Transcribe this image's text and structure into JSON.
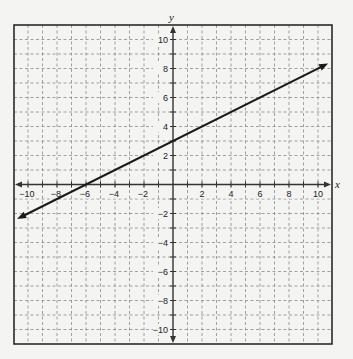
{
  "chart_data": {
    "type": "line",
    "title": "",
    "xlabel": "x",
    "ylabel": "y",
    "xlim": [
      -11,
      11
    ],
    "ylim": [
      -11,
      11
    ],
    "grid": true,
    "grid_style": "dashed",
    "x_ticks": [
      -10,
      -8,
      -6,
      -4,
      -2,
      2,
      4,
      6,
      8,
      10
    ],
    "y_ticks": [
      -10,
      -8,
      -6,
      -4,
      -2,
      2,
      4,
      6,
      8,
      10
    ],
    "x_tick_labels": [
      "−10",
      "−8",
      "−6",
      "−4",
      "−2",
      "2",
      "4",
      "6",
      "8",
      "10"
    ],
    "y_tick_labels": [
      "−10",
      "−8",
      "−6",
      "−4",
      "−2",
      "2",
      "4",
      "6",
      "8",
      "10"
    ],
    "series": [
      {
        "name": "line",
        "equation": "y = 0.5x + 3",
        "slope": 0.5,
        "y_intercept": 3,
        "x_intercept": -6,
        "x": [
          -10.75,
          -6,
          0,
          10.7
        ],
        "y": [
          -2.375,
          0,
          3,
          8.35
        ],
        "arrows": "both"
      }
    ],
    "legend": null
  },
  "colors": {
    "background": "#f4f4f2",
    "frame": "#2a2a2a",
    "grid": "#8a8a8a",
    "axis": "#333333",
    "line": "#1a1a1a"
  }
}
